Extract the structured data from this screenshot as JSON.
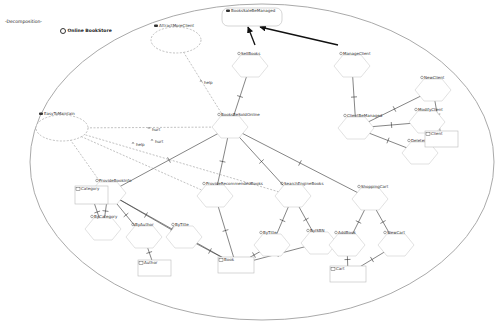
{
  "header": {
    "root_label": "-Decomposition-",
    "actor_label": "Online BookStore"
  },
  "diagram": {
    "goals": [
      {
        "id": "g1",
        "label": "BooksSaleBeManaged",
        "x": 222,
        "y": 8,
        "w": 60,
        "h": 18
      }
    ],
    "softgoals": [
      {
        "id": "s1",
        "label": "AttractMoreClient",
        "cx": 176,
        "cy": 40,
        "rx": 25,
        "ry": 13
      },
      {
        "id": "s2",
        "label": "EasyToMaintain",
        "cx": 62,
        "cy": 128,
        "rx": 26,
        "ry": 13
      }
    ],
    "tasks": [
      {
        "id": "t1",
        "label": "SellBooks",
        "cx": 250,
        "cy": 56
      },
      {
        "id": "t2",
        "label": "ManageClient",
        "cx": 352,
        "cy": 56
      },
      {
        "id": "t3",
        "label": "BooksBeSoldOnline",
        "cx": 230,
        "cy": 117
      },
      {
        "id": "t4",
        "label": "ClientBeManaged",
        "cx": 356,
        "cy": 118
      },
      {
        "id": "t5",
        "label": "NewClient",
        "cx": 433,
        "cy": 80
      },
      {
        "id": "t6",
        "label": "ModifyClient",
        "cx": 427,
        "cy": 112
      },
      {
        "id": "t7",
        "label": "DeleteClient",
        "cx": 420,
        "cy": 143
      },
      {
        "id": "t8",
        "label": "ProvideBookInfo",
        "cx": 108,
        "cy": 183
      },
      {
        "id": "t9",
        "label": "ProvideRecommendedBooks",
        "cx": 215,
        "cy": 186
      },
      {
        "id": "t10",
        "label": "SearchEngineBooks",
        "cx": 293,
        "cy": 186
      },
      {
        "id": "t11",
        "label": "ShoppingCart",
        "cx": 370,
        "cy": 189
      },
      {
        "id": "t12",
        "label": "ByCategory",
        "cx": 103,
        "cy": 219
      },
      {
        "id": "t13",
        "label": "ByAuthor",
        "cx": 144,
        "cy": 227
      },
      {
        "id": "t14",
        "label": "ByTitle",
        "cx": 184,
        "cy": 227
      },
      {
        "id": "t15",
        "label": "ByTitle",
        "cx": 272,
        "cy": 235
      },
      {
        "id": "t16",
        "label": "ByISBN",
        "cx": 319,
        "cy": 233
      },
      {
        "id": "t17",
        "label": "AddBook",
        "cx": 347,
        "cy": 235
      },
      {
        "id": "t18",
        "label": "ViewCart",
        "cx": 396,
        "cy": 235
      }
    ],
    "resources": [
      {
        "id": "r1",
        "label": "Category",
        "x": 75,
        "y": 186,
        "w": 33,
        "h": 18
      },
      {
        "id": "r2",
        "label": "Author",
        "x": 138,
        "y": 260,
        "w": 33,
        "h": 16
      },
      {
        "id": "r3",
        "label": "Book",
        "x": 218,
        "y": 257,
        "w": 36,
        "h": 16
      },
      {
        "id": "r4",
        "label": "Cart",
        "x": 330,
        "y": 266,
        "w": 36,
        "h": 16
      },
      {
        "id": "r5",
        "label": "Client",
        "x": 425,
        "y": 131,
        "w": 33,
        "h": 16
      }
    ],
    "contribution_labels": [
      {
        "label": "help",
        "x": 204,
        "y": 84
      },
      {
        "label": "hurt",
        "x": 152,
        "y": 131
      },
      {
        "label": "hurt",
        "x": 155,
        "y": 143
      },
      {
        "label": "help",
        "x": 136,
        "y": 146
      }
    ],
    "boundary": {
      "cx": 262,
      "cy": 162,
      "rx": 232,
      "ry": 158
    }
  }
}
